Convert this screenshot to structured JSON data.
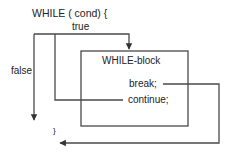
{
  "diagram": {
    "header": "WHILE ( cond) {",
    "true_label": "true",
    "false_label": "false",
    "block_label": "WHILE-block",
    "break_label": "break;",
    "continue_label": "continue;",
    "closing_brace": "}",
    "colors": {
      "line": "#4a4a4a",
      "text": "#222222",
      "background": "#ffffff"
    }
  }
}
